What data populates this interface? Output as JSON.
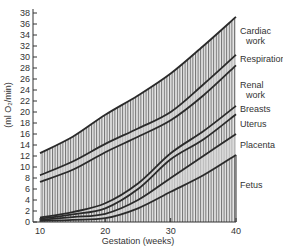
{
  "chart_data": {
    "type": "area",
    "title": "",
    "xlabel": "Gestation (weeks)",
    "ylabel": "(ml O₂/min)",
    "xlim": [
      10,
      40
    ],
    "ylim": [
      0,
      38
    ],
    "x_ticks": [
      10,
      20,
      30,
      40
    ],
    "y_ticks": [
      0,
      2,
      4,
      6,
      8,
      10,
      12,
      14,
      16,
      18,
      20,
      22,
      24,
      26,
      28,
      30,
      32,
      34,
      36,
      38
    ],
    "grid": false,
    "legend_position": "right, inline labels",
    "stacked": true,
    "x": [
      10,
      15,
      20,
      25,
      30,
      35,
      40
    ],
    "series": [
      {
        "name": "Cardiac work",
        "label_lines": [
          "Cardiac",
          "work"
        ],
        "values": [
          12.5,
          15.5,
          19.5,
          23,
          27,
          32,
          37.3
        ]
      },
      {
        "name": "Respiration",
        "label_lines": [
          "Respiration"
        ],
        "values": [
          8.5,
          11,
          14.2,
          17,
          20,
          25,
          30.4
        ]
      },
      {
        "name": "Renal work",
        "label_lines": [
          "Renal",
          "work"
        ],
        "values": [
          7.3,
          9.5,
          12.7,
          15.5,
          18.5,
          23,
          28.5
        ]
      },
      {
        "name": "Breasts",
        "label_lines": [
          "Breasts"
        ],
        "values": [
          0.8,
          1.8,
          3.4,
          7,
          12.5,
          16.5,
          21.1
        ]
      },
      {
        "name": "Uterus",
        "label_lines": [
          "Uterus"
        ],
        "values": [
          0.6,
          1.4,
          2.5,
          6,
          11.4,
          15,
          19.6
        ]
      },
      {
        "name": "Placenta",
        "label_lines": [
          "Placenta"
        ],
        "values": [
          0.4,
          0.9,
          1.5,
          4,
          8,
          12,
          16
        ]
      },
      {
        "name": "Fetus",
        "label_lines": [
          "Fetus"
        ],
        "values": [
          0.2,
          0.4,
          0.7,
          2.5,
          5.5,
          8.5,
          12.2
        ]
      }
    ],
    "colors": {
      "line": "#2a2a2a",
      "hatch": "#6a6a6a",
      "band_light": "#d9d9d9",
      "band_hatch_bg": "#e4e4e4"
    }
  }
}
